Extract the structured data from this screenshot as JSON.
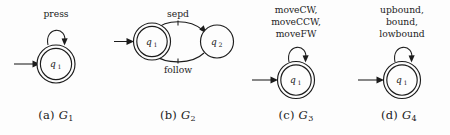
{
  "figure": {
    "background_color": "#fdfdfd",
    "stroke_color": "#1c1c1c",
    "panels": [
      {
        "id": "a",
        "caption_prefix": "(a)",
        "machine_name": "G",
        "machine_sub": "1",
        "state_label": "q",
        "state_sub": "1",
        "accepting": true,
        "events": [
          "press"
        ]
      },
      {
        "id": "b",
        "caption_prefix": "(b)",
        "machine_name": "G",
        "machine_sub": "2",
        "state_label": "q",
        "state_sub": "1",
        "state2_label": "q",
        "state2_sub": "2",
        "accepting": true,
        "events": [
          "sepd",
          "follow"
        ]
      },
      {
        "id": "c",
        "caption_prefix": "(c)",
        "machine_name": "G",
        "machine_sub": "3",
        "state_label": "q",
        "state_sub": "1",
        "accepting": true,
        "events": [
          "moveCW,",
          "moveCCW,",
          "moveFW"
        ]
      },
      {
        "id": "d",
        "caption_prefix": "(d)",
        "machine_name": "G",
        "machine_sub": "4",
        "state_label": "q",
        "state_sub": "1",
        "accepting": true,
        "events": [
          "upbound,",
          "bound,",
          "lowbound"
        ]
      }
    ]
  }
}
